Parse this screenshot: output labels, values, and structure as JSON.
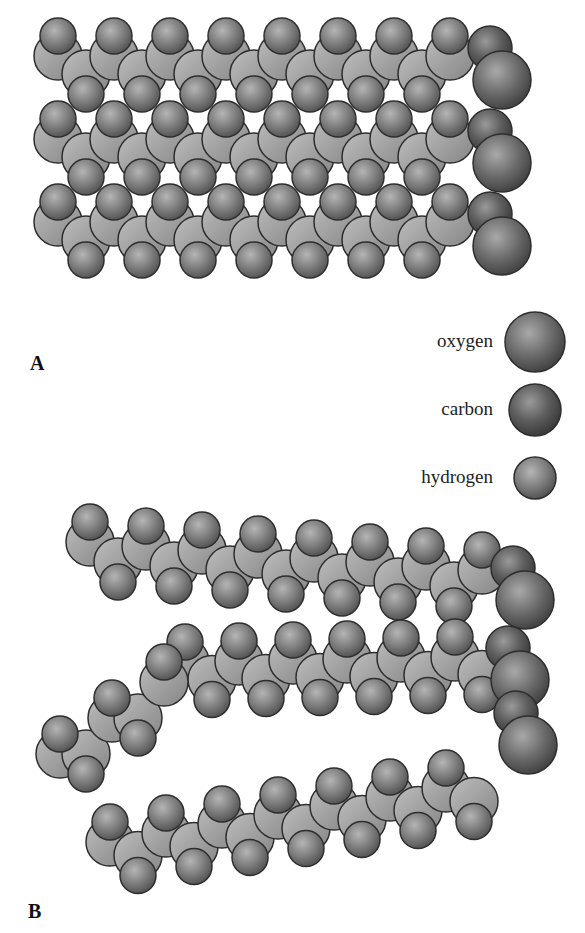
{
  "figure": {
    "panels": [
      {
        "id": "A",
        "label": "A",
        "description": "Three straight saturated fatty acid chains packed tightly side by side"
      },
      {
        "id": "B",
        "label": "B",
        "description": "Three fatty acid chains with bends (cis double bonds) that prevent tight packing"
      }
    ],
    "legend": [
      {
        "label": "oxygen",
        "radius": 30,
        "color": "#6e6e6e"
      },
      {
        "label": "carbon",
        "radius": 26,
        "color": "#5a5a5a"
      },
      {
        "label": "hydrogen",
        "radius": 21,
        "color": "#8a8a8a"
      }
    ],
    "colors": {
      "background": "#ffffff",
      "atom_fill": "#7a7a7a",
      "carbon_fill": "#a8a8a8",
      "outline": "#333333",
      "oxygen_fill": "#6b6b6b"
    }
  }
}
